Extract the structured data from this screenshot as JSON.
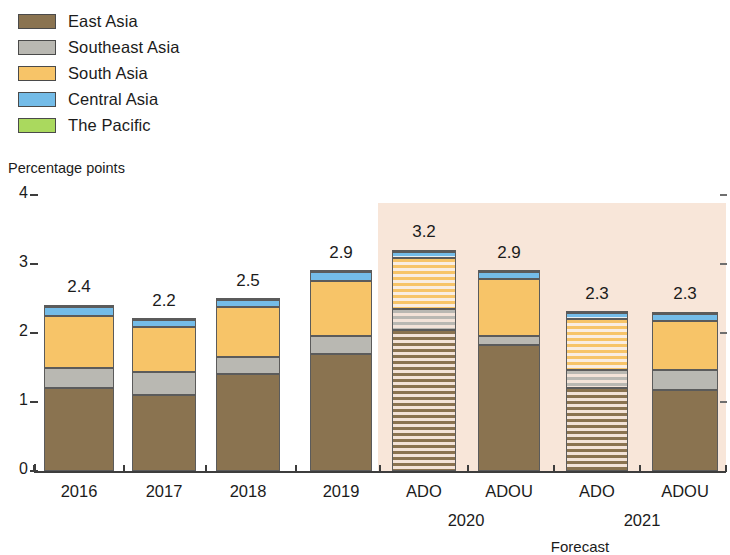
{
  "chart_data": {
    "type": "bar",
    "stacked": true,
    "title": "",
    "subtitle": "",
    "xlabel": "",
    "ylabel": "Percentage points",
    "ylim": [
      0,
      4
    ],
    "ytick_labels": [
      "0",
      "1",
      "2",
      "3",
      "4"
    ],
    "ytick_values": [
      0,
      1,
      2,
      3,
      4
    ],
    "grid": false,
    "legend_position": "top-left",
    "categories": [
      "2016",
      "2017",
      "2018",
      "2019",
      "ADO",
      "ADOU",
      "ADO",
      "ADOU"
    ],
    "group_labels": [
      "2020",
      "2021"
    ],
    "forecast_caption": "Forecast",
    "forecast_from_index": 4,
    "hatched_indices": [
      4,
      6
    ],
    "totals": [
      "2.4",
      "2.2",
      "2.5",
      "2.9",
      "3.2",
      "2.9",
      "2.3",
      "2.3"
    ],
    "total_values": [
      2.4,
      2.2,
      2.5,
      2.9,
      3.2,
      2.9,
      2.3,
      2.3
    ],
    "series": [
      {
        "name": "East Asia",
        "color": "#8a7350",
        "values": [
          1.21,
          1.1,
          1.4,
          1.7,
          2.05,
          1.82,
          1.2,
          1.18
        ]
      },
      {
        "name": "Southeast Asia",
        "color": "#b9b8b2",
        "values": [
          0.29,
          0.33,
          0.25,
          0.26,
          0.3,
          0.14,
          0.26,
          0.29
        ]
      },
      {
        "name": "South Asia",
        "color": "#f7c468",
        "values": [
          0.75,
          0.66,
          0.72,
          0.8,
          0.74,
          0.82,
          0.74,
          0.71
        ]
      },
      {
        "name": "Central Asia",
        "color": "#74bce8",
        "values": [
          0.12,
          0.1,
          0.11,
          0.12,
          0.09,
          0.11,
          0.09,
          0.1
        ]
      },
      {
        "name": "The Pacific",
        "color": "#aad95e",
        "values": [
          0.03,
          0.01,
          0.02,
          0.02,
          0.02,
          0.01,
          0.01,
          0.02
        ]
      }
    ]
  },
  "legend": {
    "items": [
      {
        "label": "East Asia",
        "color": "#8a7350"
      },
      {
        "label": "Southeast Asia",
        "color": "#b9b8b2"
      },
      {
        "label": "South Asia",
        "color": "#f7c468"
      },
      {
        "label": "Central Asia",
        "color": "#74bce8"
      },
      {
        "label": "The Pacific",
        "color": "#aad95e"
      }
    ]
  },
  "axes": {
    "y_title": "Percentage points"
  },
  "colors": {
    "forecast_band": "#f8e6d9",
    "axis": "#3d3d3d",
    "text": "#1b1b1b"
  }
}
